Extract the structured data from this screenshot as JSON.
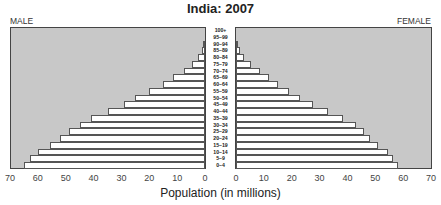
{
  "chart_data": {
    "type": "bar",
    "subtype": "population-pyramid",
    "title": "India: 2007",
    "xlabel": "Population (in millions)",
    "ylabel": "",
    "left_label": "MALE",
    "right_label": "FEMALE",
    "xlim": [
      0,
      70
    ],
    "x_ticks": [
      0,
      10,
      20,
      30,
      40,
      50,
      60,
      70
    ],
    "grid": false,
    "legend": "none",
    "categories": [
      "0–4",
      "5–9",
      "10–14",
      "15–19",
      "20–24",
      "25–29",
      "30–34",
      "35–39",
      "40–44",
      "45–49",
      "50–54",
      "55–59",
      "60–64",
      "65–69",
      "70–74",
      "75–79",
      "80–84",
      "85–89",
      "90–94",
      "95–99",
      "100+"
    ],
    "series": [
      {
        "name": "MALE",
        "values": [
          65,
          63,
          60,
          55.5,
          52,
          49,
          45,
          41,
          35,
          29,
          25,
          20,
          15,
          11.5,
          7.5,
          4.7,
          2.5,
          1.1,
          0.3,
          0.05,
          0.01
        ]
      },
      {
        "name": "FEMALE",
        "values": [
          58,
          56.5,
          54.5,
          51,
          48,
          46,
          43,
          38.5,
          33,
          27.5,
          23,
          19,
          15,
          12,
          8.5,
          5.4,
          2.9,
          1.4,
          0.4,
          0.05,
          0.01
        ]
      }
    ]
  },
  "labels": {
    "title": "India: 2007",
    "male": "MALE",
    "female": "FEMALE",
    "xlabel": "Population (in millions)"
  },
  "male_ticks": [
    "70",
    "60",
    "50",
    "40",
    "30",
    "20",
    "10",
    "0"
  ],
  "female_ticks": [
    "0",
    "10",
    "20",
    "30",
    "40",
    "50",
    "60",
    "70"
  ],
  "age_labels_top_down": [
    "100+",
    "95–99",
    "90–94",
    "85–89",
    "80–84",
    "75–79",
    "70–74",
    "65–69",
    "60–64",
    "55–59",
    "50–54",
    "45–49",
    "40–44",
    "35–39",
    "30–34",
    "25–29",
    "20–24",
    "15–19",
    "10–14",
    "5–9",
    "0–4"
  ]
}
